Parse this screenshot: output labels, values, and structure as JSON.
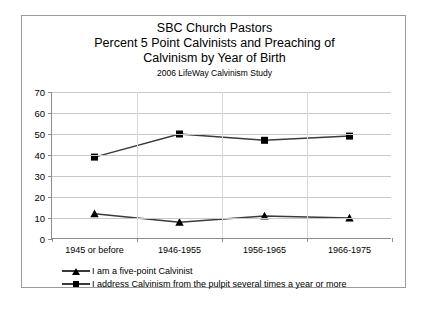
{
  "chart_data": {
    "type": "line",
    "title": "SBC Church Pastors",
    "title_line1": "SBC Church Pastors",
    "title_line2": "Percent 5 Point Calvinists and Preaching of",
    "title_line3": "Calvinism by Year of Birth",
    "subtitle": "2006 LifeWay Calvinism Study",
    "xlabel": "",
    "ylabel": "",
    "ylim": [
      0,
      70
    ],
    "ytick_step": 10,
    "yticks": [
      0,
      10,
      20,
      30,
      40,
      50,
      60,
      70
    ],
    "grid": true,
    "legend_position": "bottom",
    "categories": [
      "1945 or before",
      "1946-1955",
      "1956-1965",
      "1966-1975"
    ],
    "series": [
      {
        "name": "I am a five-point Calvinist",
        "marker": "triangle",
        "color": "#000000",
        "values": [
          12,
          8,
          11,
          10
        ]
      },
      {
        "name": "I address Calvinism from the pulpit several times a year or more",
        "marker": "square",
        "color": "#000000",
        "values": [
          39,
          50,
          47,
          49
        ]
      }
    ]
  },
  "legend": {
    "items": [
      {
        "label": "I am a five-point Calvinist",
        "marker": "triangle"
      },
      {
        "label": "I address Calvinism from the pulpit several times a year or more",
        "marker": "square"
      }
    ]
  },
  "colors": {
    "line": "#3a3a3a",
    "marker": "#000000",
    "grid": "#c8c8c8",
    "axis": "#8d8d8d",
    "border": "#9a9a9a",
    "background": "#ffffff"
  }
}
